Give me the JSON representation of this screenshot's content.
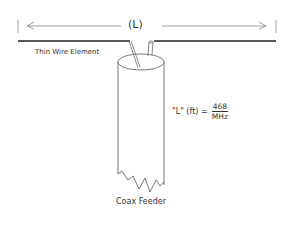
{
  "diagram": {
    "dimension_label": "(L)",
    "wire_label": "Thin Wire Element",
    "feeder_label": "Coax Feeder",
    "formula": {
      "lhs": "\"L\" (ft) =",
      "numerator": "468",
      "denominator": "MHz"
    }
  }
}
